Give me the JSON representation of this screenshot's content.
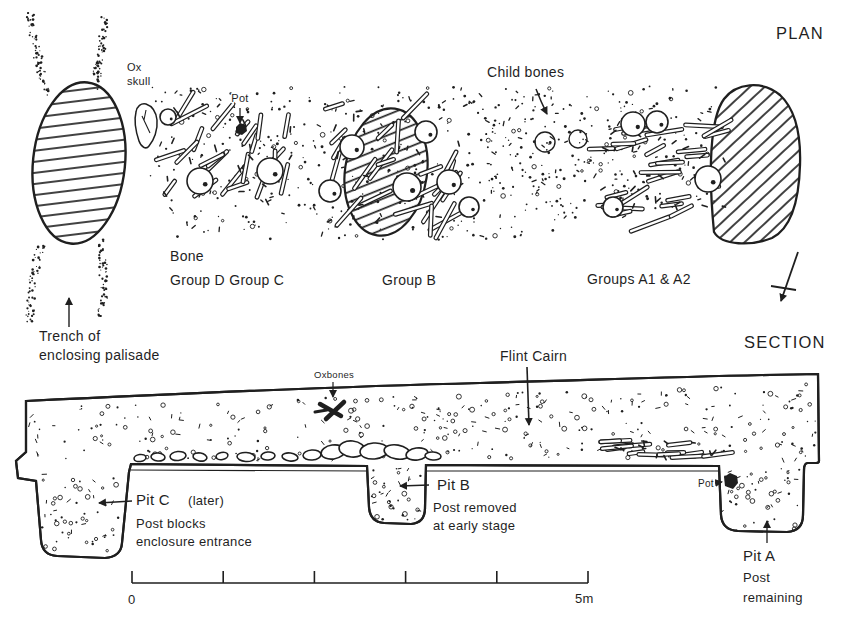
{
  "figure": {
    "ink": "#1f1f1f",
    "paper": "#ffffff"
  },
  "plan": {
    "title": "PLAN",
    "labels": {
      "ox_skull": [
        "Ox",
        "skull"
      ],
      "pot": "Pot",
      "child_bones": "Child bones",
      "bone_groups_dc": [
        "Bone",
        "Group D Group C"
      ],
      "group_b": "Group B",
      "groups_a": "Groups A1 & A2",
      "trench": [
        "Trench of",
        "enclosing palisade"
      ]
    }
  },
  "section": {
    "title": "SECTION",
    "labels": {
      "flint_cairn": "Flint Cairn",
      "oxbones": "Oxbones",
      "pot": "Pot",
      "pit_c": {
        "name": "Pit C",
        "note": "(later)",
        "desc": [
          "Post blocks",
          "enclosure entrance"
        ]
      },
      "pit_b": {
        "name": "Pit B",
        "desc": [
          "Post removed",
          "at early stage"
        ]
      },
      "pit_a": {
        "name": "Pit A",
        "desc": [
          "Post",
          "remaining"
        ]
      }
    },
    "scale_bar": {
      "start": "0",
      "end": "5m",
      "divisions": 5
    }
  }
}
